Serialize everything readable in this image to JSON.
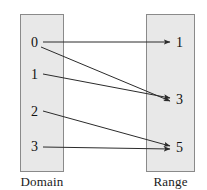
{
  "figure": {
    "type": "mapping-diagram",
    "domain": {
      "caption": "Domain",
      "elements": [
        {
          "label": "0",
          "x": 31,
          "y": 36
        },
        {
          "label": "1",
          "x": 31,
          "y": 68
        },
        {
          "label": "2",
          "x": 31,
          "y": 105
        },
        {
          "label": "3",
          "x": 31,
          "y": 140
        }
      ]
    },
    "range": {
      "caption": "Range",
      "elements": [
        {
          "label": "1",
          "x": 176,
          "y": 36
        },
        {
          "label": "3",
          "x": 176,
          "y": 93
        },
        {
          "label": "5",
          "x": 176,
          "y": 141
        }
      ]
    },
    "mappings": [
      {
        "from": "0",
        "to": "1",
        "x1": 43,
        "y1": 42,
        "x2": 170,
        "y2": 42
      },
      {
        "from": "0",
        "to": "3",
        "x1": 41,
        "y1": 47,
        "x2": 170,
        "y2": 101
      },
      {
        "from": "1",
        "to": "3",
        "x1": 43,
        "y1": 74,
        "x2": 170,
        "y2": 98
      },
      {
        "from": "2",
        "to": "5",
        "x1": 43,
        "y1": 111,
        "x2": 170,
        "y2": 146
      },
      {
        "from": "3",
        "to": "5",
        "x1": 43,
        "y1": 147,
        "x2": 170,
        "y2": 149
      }
    ],
    "colors": {
      "box_fill": "#e8e8e8",
      "box_stroke": "#8a8a8a",
      "arrow": "#2b2b2b",
      "text": "#111111",
      "background": "#ffffff"
    }
  }
}
